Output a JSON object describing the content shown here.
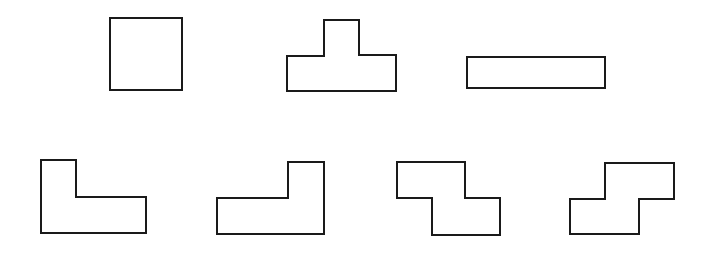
{
  "figure": {
    "stroke_color": "#1a1a1a",
    "fill_color": "#ffffff",
    "background": "#ffffff"
  },
  "rows": [
    {
      "name": "top-row",
      "pieces": [
        {
          "id": "O",
          "label": "square-piece",
          "points": "110,18 182,18 182,90 110,90"
        },
        {
          "id": "T",
          "label": "t-piece",
          "points": "324,20 359,20 359,55 396,55 396,91 287,91 287,56 324,56"
        },
        {
          "id": "I",
          "label": "straight-piece",
          "points": "467,57 605,57 605,88 467,88"
        }
      ]
    },
    {
      "name": "bottom-row",
      "pieces": [
        {
          "id": "L",
          "label": "l-piece",
          "points": "41,160 76,160 76,197 146,197 146,233 41,233"
        },
        {
          "id": "J",
          "label": "j-piece",
          "points": "288,162 324,162 324,234 217,234 217,198 288,198"
        },
        {
          "id": "Z",
          "label": "z-piece",
          "points": "397,162 465,162 465,198 500,198 500,235 432,235 432,198 397,198"
        },
        {
          "id": "S",
          "label": "s-piece",
          "points": "605,163 674,163 674,199 639,199 639,234 570,234 570,199 605,199"
        }
      ]
    }
  ]
}
